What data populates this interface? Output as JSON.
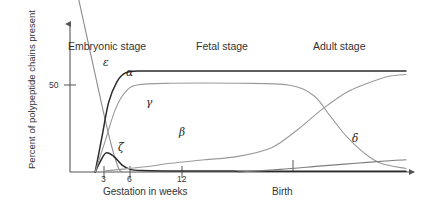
{
  "chart_data": {
    "type": "line",
    "title": "",
    "xlabel": "Gestation in weeks",
    "ylabel": "Percent of polypeptide chains present",
    "xlim": [
      0,
      40
    ],
    "ylim": [
      0,
      100
    ],
    "grid": false,
    "legend_position": "inline-annotations",
    "x_ticks": [
      "3",
      "6",
      "12"
    ],
    "x_tick_values": [
      3,
      6,
      12
    ],
    "y_ticks": [
      "50"
    ],
    "y_tick_values": [
      50
    ],
    "secondary_x_ticks": [
      "Birth"
    ],
    "stage_annotations": [
      "Embryonic stage",
      "Fetal stage",
      "Adult stage"
    ],
    "series": [
      {
        "name": "ε",
        "label": "epsilon",
        "color": "#8c8c8c",
        "points": [
          [
            1.0,
            100
          ],
          [
            2.0,
            78
          ],
          [
            3.0,
            56
          ],
          [
            4.0,
            34
          ],
          [
            5.0,
            14
          ],
          [
            5.8,
            2
          ],
          [
            6.2,
            0
          ]
        ]
      },
      {
        "name": "ζ",
        "label": "zeta",
        "color": "#2b2b2b",
        "points": [
          [
            3.0,
            0
          ],
          [
            3.6,
            6
          ],
          [
            4.3,
            11
          ],
          [
            5.2,
            9
          ],
          [
            6.2,
            4
          ],
          [
            7.2,
            1.5
          ],
          [
            8.5,
            0.8
          ],
          [
            12,
            0.6
          ],
          [
            20,
            0.5
          ],
          [
            30,
            0.4
          ],
          [
            40,
            0.4
          ]
        ]
      },
      {
        "name": "α",
        "label": "alpha",
        "color": "#2b2b2b",
        "points": [
          [
            3.0,
            0
          ],
          [
            3.8,
            20
          ],
          [
            4.6,
            40
          ],
          [
            5.6,
            52
          ],
          [
            6.6,
            57
          ],
          [
            8.0,
            58
          ],
          [
            12,
            58
          ],
          [
            20,
            58
          ],
          [
            30,
            58
          ],
          [
            40,
            58
          ]
        ]
      },
      {
        "name": "γ",
        "label": "gamma",
        "color": "#9a9a9a",
        "points": [
          [
            3.0,
            0
          ],
          [
            4.2,
            18
          ],
          [
            5.4,
            36
          ],
          [
            6.6,
            46
          ],
          [
            8.0,
            50
          ],
          [
            12,
            51
          ],
          [
            20,
            51
          ],
          [
            26,
            50
          ],
          [
            29,
            44
          ],
          [
            31,
            32
          ],
          [
            33,
            20
          ],
          [
            35,
            11
          ],
          [
            37,
            5
          ],
          [
            40,
            2
          ]
        ]
      },
      {
        "name": "β",
        "label": "beta",
        "color": "#9a9a9a",
        "points": [
          [
            4.0,
            0.5
          ],
          [
            6,
            1.5
          ],
          [
            9,
            3
          ],
          [
            12,
            5
          ],
          [
            16,
            7
          ],
          [
            20,
            9
          ],
          [
            24,
            14
          ],
          [
            27,
            24
          ],
          [
            30,
            36
          ],
          [
            33,
            46
          ],
          [
            36,
            52
          ],
          [
            38,
            55
          ],
          [
            40,
            56
          ]
        ]
      },
      {
        "name": "δ",
        "label": "delta",
        "color": "#7d7d7d",
        "points": [
          [
            20,
            0
          ],
          [
            25,
            1.5
          ],
          [
            30,
            3.5
          ],
          [
            34,
            5
          ],
          [
            38,
            6.5
          ],
          [
            40,
            7
          ]
        ]
      }
    ]
  },
  "axis": {
    "y_label": "Percent of polypeptide chains present",
    "x_label": "Gestation in weeks",
    "birth_label": "Birth",
    "y_tick_50": "50",
    "x_tick_3": "3",
    "x_tick_6": "6",
    "x_tick_12": "12"
  },
  "stages": {
    "embryonic": "Embryonic stage",
    "fetal": "Fetal stage",
    "adult": "Adult stage"
  },
  "curve_labels": {
    "epsilon": "ε",
    "zeta": "ζ",
    "alpha": "α",
    "gamma": "γ",
    "beta": "β",
    "delta": "δ"
  }
}
